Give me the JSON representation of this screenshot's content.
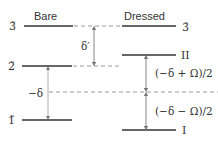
{
  "diagram": {
    "headers": {
      "bare": "Bare",
      "dressed": "Dressed"
    },
    "levels": {
      "bare_3": "3̃",
      "bare_2": "2̃",
      "bare_1": "1̃",
      "dressed_3": "3̃",
      "dressed_II": "II",
      "dressed_I": "I"
    },
    "gaps": {
      "delta_prime": "δ′",
      "minus_delta": "−δ",
      "upper_right": "(−δ + Ω)/2",
      "lower_right": "(−δ − Ω)/2"
    },
    "colors": {
      "line": "#333333",
      "dashed": "#9a9a9a",
      "arrow": "#777777"
    }
  }
}
